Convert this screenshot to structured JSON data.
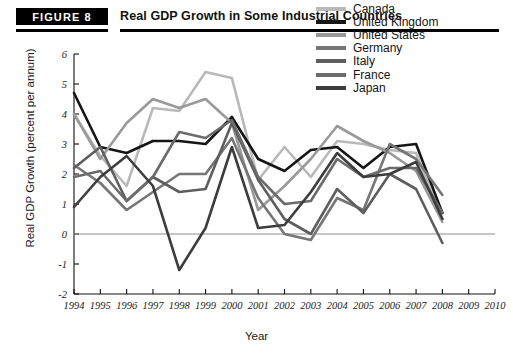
{
  "figure": {
    "badge": "FIGURE 8",
    "title": "Real GDP Growth in Some Industrial Countries"
  },
  "chart_data": {
    "type": "line",
    "title": "Real GDP Growth in Some Industrial Countries",
    "xlabel": "Year",
    "ylabel": "Real GDP Growth (percent per annum)",
    "xlim": [
      1994,
      2010
    ],
    "ylim": [
      -2,
      6
    ],
    "xticks": [
      1994,
      1995,
      1996,
      1997,
      1998,
      1999,
      2000,
      2001,
      2002,
      2003,
      2004,
      2005,
      2006,
      2007,
      2008,
      2009,
      2010
    ],
    "yticks": [
      -2,
      -1,
      0,
      1,
      2,
      3,
      4,
      5,
      6
    ],
    "grid": false,
    "zero_line": true,
    "legend_position": "top-right",
    "x": [
      1994,
      1995,
      1996,
      1997,
      1998,
      1999,
      2000,
      2001,
      2002,
      2003,
      2004,
      2005,
      2006,
      2007,
      2008
    ],
    "series": [
      {
        "name": "Canada",
        "color": "#b9b9b9",
        "values": [
          4.0,
          2.6,
          1.6,
          4.2,
          4.1,
          5.4,
          5.2,
          1.8,
          2.9,
          1.9,
          3.1,
          3.0,
          2.8,
          2.7,
          0.5
        ]
      },
      {
        "name": "United Kingdom",
        "color": "#151515",
        "values": [
          4.7,
          2.9,
          2.7,
          3.1,
          3.1,
          3.0,
          3.9,
          2.5,
          2.1,
          2.8,
          2.9,
          2.2,
          2.9,
          3.0,
          0.7
        ]
      },
      {
        "name": "United States",
        "color": "#999999",
        "values": [
          4.0,
          2.5,
          3.7,
          4.5,
          4.2,
          4.5,
          3.7,
          0.8,
          1.6,
          2.5,
          3.6,
          3.1,
          2.7,
          2.1,
          0.4
        ]
      },
      {
        "name": "Germany",
        "color": "#767676",
        "values": [
          2.3,
          1.7,
          0.8,
          1.4,
          2.0,
          2.0,
          3.2,
          1.2,
          0.0,
          -0.2,
          1.2,
          0.8,
          3.0,
          2.5,
          1.3
        ]
      },
      {
        "name": "Italy",
        "color": "#5e5e5e",
        "values": [
          2.2,
          2.9,
          1.1,
          1.9,
          1.4,
          1.5,
          3.7,
          1.8,
          0.5,
          0.0,
          1.5,
          0.7,
          2.0,
          1.5,
          -0.3
        ]
      },
      {
        "name": "France",
        "color": "#6b6b6b",
        "values": [
          1.9,
          2.1,
          1.1,
          1.9,
          3.4,
          3.2,
          3.8,
          1.9,
          1.0,
          1.1,
          2.5,
          1.9,
          2.2,
          2.2,
          0.7
        ]
      },
      {
        "name": "Japan",
        "color": "#3d3d3d",
        "values": [
          0.9,
          1.9,
          2.6,
          1.6,
          -1.2,
          0.2,
          2.9,
          0.2,
          0.3,
          1.4,
          2.7,
          1.9,
          2.0,
          2.4,
          0.5
        ]
      }
    ]
  },
  "legend": {
    "items": [
      {
        "label": "Canada",
        "color": "#b9b9b9"
      },
      {
        "label": "United Kingdom",
        "color": "#151515"
      },
      {
        "label": "United States",
        "color": "#999999"
      },
      {
        "label": "Germany",
        "color": "#767676"
      },
      {
        "label": "Italy",
        "color": "#5e5e5e"
      },
      {
        "label": "France",
        "color": "#6b6b6b"
      },
      {
        "label": "Japan",
        "color": "#3d3d3d"
      }
    ]
  }
}
